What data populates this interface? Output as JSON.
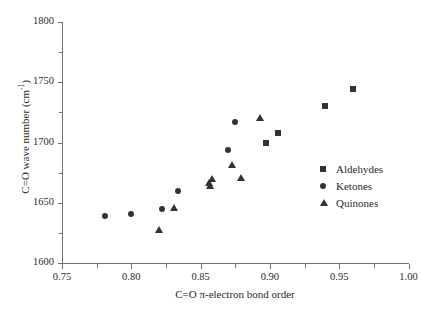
{
  "chart_data": {
    "type": "scatter",
    "title": "",
    "xlabel": "C=O π-electron bond order",
    "ylabel": "C=O wave number (cm-1)",
    "xlim": [
      0.75,
      1.0
    ],
    "ylim": [
      1600,
      1800
    ],
    "xticks": [
      "0.75",
      "0.80",
      "0.85",
      "0.90",
      "0.95",
      "1.00"
    ],
    "xtick_values": [
      0.75,
      0.8,
      0.85,
      0.9,
      0.95,
      1.0
    ],
    "yticks": [
      "1600",
      "1650",
      "1700",
      "1750",
      "1800"
    ],
    "ytick_values": [
      1600,
      1650,
      1700,
      1750,
      1800
    ],
    "minor_ticks": true,
    "grid": false,
    "legend_position": "right-middle",
    "series": [
      {
        "name": "Aldehydes",
        "marker": "square",
        "color": "#333333",
        "points": [
          {
            "x": 0.897,
            "y": 1700
          },
          {
            "x": 0.906,
            "y": 1708
          },
          {
            "x": 0.94,
            "y": 1730
          },
          {
            "x": 0.96,
            "y": 1744
          }
        ]
      },
      {
        "name": "Ketones",
        "marker": "circle",
        "color": "#333333",
        "points": [
          {
            "x": 0.781,
            "y": 1639
          },
          {
            "x": 0.8,
            "y": 1641
          },
          {
            "x": 0.822,
            "y": 1645
          },
          {
            "x": 0.834,
            "y": 1660
          },
          {
            "x": 0.87,
            "y": 1694
          },
          {
            "x": 0.875,
            "y": 1717
          }
        ]
      },
      {
        "name": "Quinones",
        "marker": "triangle",
        "color": "#333333",
        "points": [
          {
            "x": 0.82,
            "y": 1628
          },
          {
            "x": 0.831,
            "y": 1646
          },
          {
            "x": 0.856,
            "y": 1667
          },
          {
            "x": 0.857,
            "y": 1664
          },
          {
            "x": 0.858,
            "y": 1670
          },
          {
            "x": 0.873,
            "y": 1682
          },
          {
            "x": 0.879,
            "y": 1671
          },
          {
            "x": 0.893,
            "y": 1721
          }
        ]
      }
    ]
  },
  "legend": {
    "items": [
      {
        "label": "Aldehydes",
        "marker": "square"
      },
      {
        "label": "Ketones",
        "marker": "circle"
      },
      {
        "label": "Quinones",
        "marker": "triangle"
      }
    ]
  },
  "axis_titles": {
    "y_main": "C=O wave number (cm",
    "y_sup": "-1",
    "y_tail": ")",
    "x": "C=O π-electron bond order"
  }
}
